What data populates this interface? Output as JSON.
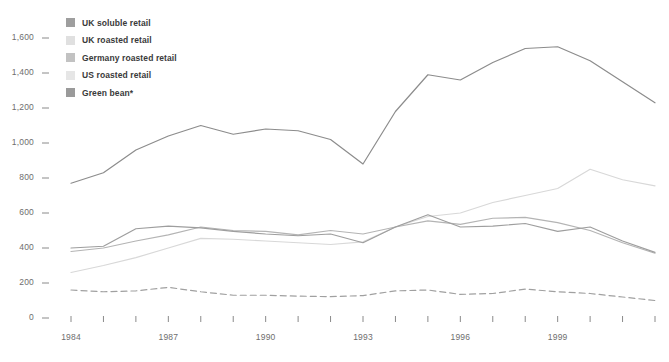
{
  "chart_data": {
    "type": "line",
    "title": "",
    "subtitle": "",
    "xlabel": "",
    "ylabel": "",
    "xlim": [
      1984,
      2002
    ],
    "ylim": [
      0,
      1600
    ],
    "grid": false,
    "legend_position": "top-left",
    "x": [
      1984,
      1985,
      1986,
      1987,
      1988,
      1989,
      1990,
      1991,
      1992,
      1993,
      1994,
      1995,
      1996,
      1997,
      1998,
      1999,
      2000,
      2001,
      2002
    ],
    "x_tick_labels": [
      "1984",
      "1987",
      "1990",
      "1993",
      "1996",
      "1999"
    ],
    "x_tick_values": [
      1984,
      1987,
      1990,
      1993,
      1996,
      1999
    ],
    "y_tick_labels": [
      "0",
      "200",
      "400",
      "600",
      "800",
      "1,000",
      "1,200",
      "1,400",
      "1,600"
    ],
    "y_tick_values": [
      0,
      200,
      400,
      600,
      800,
      1000,
      1200,
      1400,
      1600
    ],
    "series": [
      {
        "name": "US roasted retail",
        "color": "#8c8c8c",
        "dash": "none",
        "values": [
          770,
          830,
          960,
          1040,
          1100,
          1050,
          1080,
          1070,
          1020,
          880,
          1180,
          1390,
          1360,
          1460,
          1540,
          1550,
          1470,
          1350,
          1230
        ]
      },
      {
        "name": "UK roasted retail",
        "color": "#d8d8d8",
        "dash": "none",
        "values": [
          260,
          300,
          345,
          400,
          455,
          450,
          440,
          430,
          420,
          435,
          520,
          580,
          600,
          660,
          700,
          740,
          850,
          790,
          755
        ]
      },
      {
        "name": "Germany roasted retail",
        "color": "#b4b4b4",
        "dash": "none",
        "values": [
          380,
          400,
          440,
          475,
          520,
          500,
          495,
          475,
          500,
          480,
          520,
          555,
          535,
          570,
          575,
          545,
          500,
          430,
          370
        ]
      },
      {
        "name": "UK soluble retail",
        "color": "#9e9e9e",
        "dash": "none",
        "values": [
          400,
          410,
          510,
          525,
          515,
          495,
          480,
          470,
          480,
          430,
          520,
          590,
          520,
          525,
          540,
          495,
          520,
          440,
          375
        ]
      },
      {
        "name": "Green bean*",
        "color": "#a0a0a0",
        "dash": "dashed",
        "values": [
          160,
          150,
          155,
          175,
          150,
          130,
          130,
          125,
          122,
          128,
          155,
          160,
          135,
          140,
          165,
          150,
          140,
          120,
          100
        ]
      }
    ]
  },
  "legend": {
    "items": [
      {
        "label": "UK soluble retail",
        "color": "#9e9e9e"
      },
      {
        "label": "UK roasted retail",
        "color": "#e0e0e0"
      },
      {
        "label": "Germany roasted retail",
        "color": "#c2c2c2"
      },
      {
        "label": "US roasted retail",
        "color": "#e6e6e6"
      },
      {
        "label": "Green bean*",
        "color": "#9a9a9a"
      }
    ]
  },
  "axes": {
    "tick_color": "#8a8a8a",
    "label_color": "#6e6e6e"
  }
}
